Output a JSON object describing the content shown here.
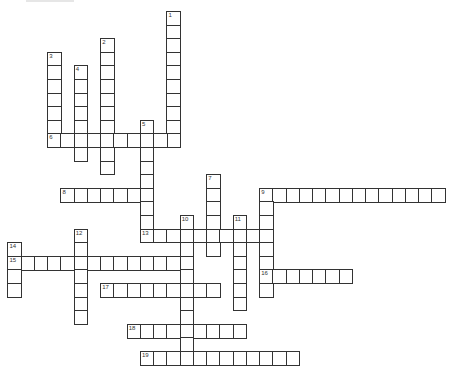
{
  "puzzle": {
    "type": "crossword",
    "grid": {
      "origin_x": 7.4,
      "origin_y": 10.9,
      "cell_w": 13.25,
      "cell_h": 13.6,
      "cols": 33,
      "rows": 26
    },
    "colors": {
      "border": "#333333",
      "cell_bg": "#ffffff",
      "number": "#333333"
    },
    "entries": [
      {
        "number": "1",
        "direction": "down",
        "row": 0,
        "col": 12,
        "length": 10
      },
      {
        "number": "2",
        "direction": "down",
        "row": 2,
        "col": 7,
        "length": 10
      },
      {
        "number": "3",
        "direction": "down",
        "row": 3,
        "col": 3,
        "length": 7
      },
      {
        "number": "4",
        "direction": "down",
        "row": 4,
        "col": 5,
        "length": 7
      },
      {
        "number": "5",
        "direction": "down",
        "row": 8,
        "col": 10,
        "length": 9
      },
      {
        "number": "6",
        "direction": "across",
        "row": 9,
        "col": 3,
        "length": 10
      },
      {
        "number": "7",
        "direction": "down",
        "row": 12,
        "col": 15,
        "length": 6
      },
      {
        "number": "8",
        "direction": "across",
        "row": 13,
        "col": 4,
        "length": 7
      },
      {
        "number": "9",
        "direction": "across",
        "row": 13,
        "col": 19,
        "length": 14
      },
      {
        "number": "9",
        "direction": "down",
        "row": 13,
        "col": 19,
        "length": 8
      },
      {
        "number": "10",
        "direction": "down",
        "row": 15,
        "col": 13,
        "length": 11
      },
      {
        "number": "11",
        "direction": "down",
        "row": 15,
        "col": 17,
        "length": 7
      },
      {
        "number": "12",
        "direction": "down",
        "row": 16,
        "col": 5,
        "length": 7
      },
      {
        "number": "13",
        "direction": "across",
        "row": 16,
        "col": 10,
        "length": 10
      },
      {
        "number": "14",
        "direction": "down",
        "row": 17,
        "col": 0,
        "length": 4
      },
      {
        "number": "15",
        "direction": "across",
        "row": 18,
        "col": 0,
        "length": 14
      },
      {
        "number": "16",
        "direction": "across",
        "row": 19,
        "col": 19,
        "length": 7
      },
      {
        "number": "17",
        "direction": "across",
        "row": 20,
        "col": 7,
        "length": 9
      },
      {
        "number": "18",
        "direction": "across",
        "row": 23,
        "col": 9,
        "length": 9
      },
      {
        "number": "19",
        "direction": "across",
        "row": 25,
        "col": 10,
        "length": 12
      }
    ]
  }
}
